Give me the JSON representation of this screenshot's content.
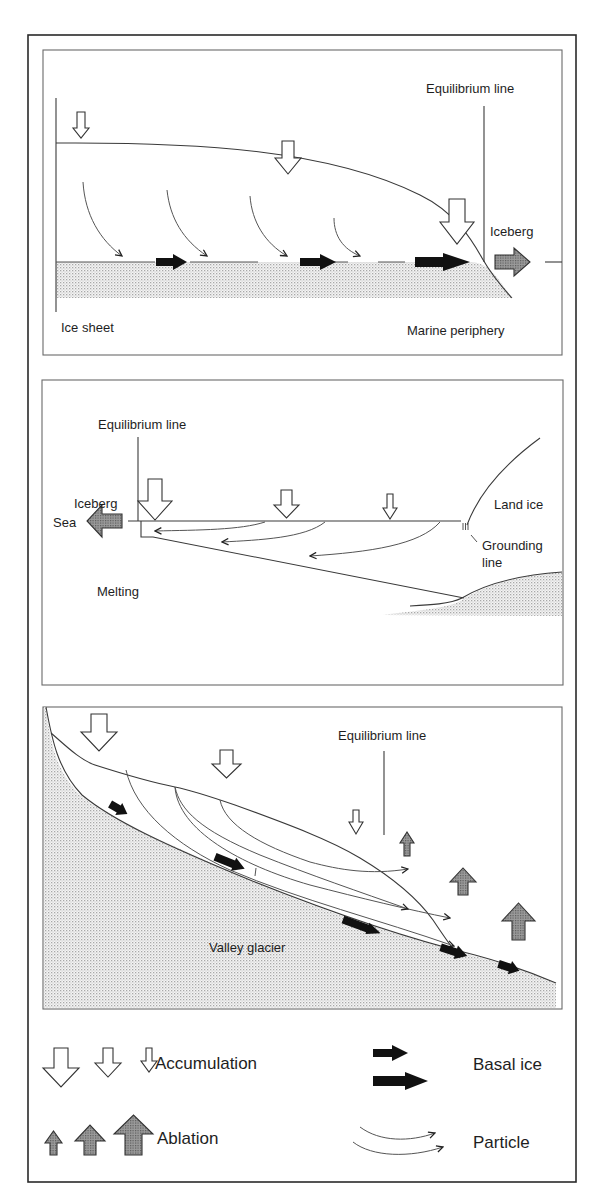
{
  "figure": {
    "panels": [
      {
        "id": "ice-sheet",
        "labels": {
          "equilibrium_line": "Equilibrium line",
          "iceberg": "Iceberg",
          "type": "Ice sheet",
          "periphery": "Marine periphery"
        }
      },
      {
        "id": "ice-shelf",
        "labels": {
          "equilibrium_line": "Equilibrium line",
          "iceberg": "Iceberg",
          "sea": "Sea",
          "land_ice": "Land ice",
          "grounding_line_1": "Grounding",
          "grounding_line_2": "line",
          "melting": "Melting"
        }
      },
      {
        "id": "valley-glacier",
        "labels": {
          "equilibrium_line": "Equilibrium line",
          "type": "Valley glacier"
        }
      }
    ],
    "legend": {
      "accumulation": "Accumulation",
      "ablation": "Ablation",
      "basal_ice": "Basal ice",
      "particle": "Particle"
    },
    "colors": {
      "line": "#3a3a3a",
      "basal_arrow": "#111111",
      "dot_fill": "#b8b8b8"
    }
  }
}
